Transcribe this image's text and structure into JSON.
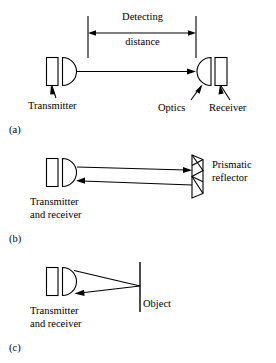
{
  "figure": {
    "stroke_color": "#000000",
    "background_color": "#ffffff",
    "stroke_width": 1
  },
  "panels": [
    {
      "tag": "(a)",
      "name": "through-beam",
      "dimension": {
        "line_top": "Detecting",
        "line_bottom": "distance"
      },
      "labels": {
        "transmitter": "Transmitter",
        "optics": "Optics",
        "receiver": "Receiver"
      }
    },
    {
      "tag": "(b)",
      "name": "retroreflective",
      "labels": {
        "device_line1": "Transmitter",
        "device_line2": "and receiver",
        "target_line1": "Prismatic",
        "target_line2": "reflector"
      }
    },
    {
      "tag": "(c)",
      "name": "diffuse-proximity",
      "labels": {
        "device_line1": "Transmitter",
        "device_line2": "and receiver",
        "target": "Object"
      }
    }
  ]
}
